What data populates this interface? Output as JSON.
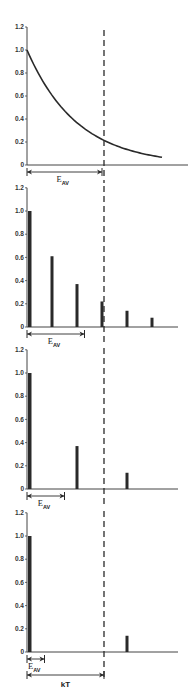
{
  "figure": {
    "dashed_line_label": "kT",
    "annotation_label_main": "E",
    "annotation_label_sub": "AV",
    "colors": {
      "ink": "#2a2a2a",
      "axis": "#444444",
      "background": "#ffffff"
    }
  },
  "chart_data": [
    {
      "type": "line",
      "title": "",
      "xlabel": "",
      "ylabel": "",
      "ylim": [
        0,
        1.2
      ],
      "yticks": [
        "0",
        "0.2",
        "0.4",
        "0.6",
        "0.8",
        "1.0",
        "1.2"
      ],
      "series": [
        {
          "name": "exponential decay",
          "x": [
            0,
            1,
            2,
            3,
            4,
            5,
            5.4
          ],
          "values": [
            1.0,
            0.61,
            0.37,
            0.22,
            0.14,
            0.08,
            0.07
          ]
        }
      ],
      "annotations": [
        {
          "type": "arrow",
          "label": "E_AV",
          "from_x": 0,
          "to_x": 3
        },
        {
          "type": "vline",
          "style": "dashed",
          "x": 3
        }
      ]
    },
    {
      "type": "bar",
      "ylim": [
        0,
        1.2
      ],
      "yticks": [
        "0",
        "0.2",
        "0.4",
        "0.6",
        "0.8",
        "1.0",
        "1.2"
      ],
      "categories": [
        0,
        1,
        2,
        3,
        4,
        5
      ],
      "values": [
        1.0,
        0.61,
        0.37,
        0.22,
        0.14,
        0.08
      ],
      "annotations": [
        {
          "type": "arrow",
          "label": "E_AV",
          "from_x": 0,
          "to_x": 2.3
        },
        {
          "type": "vline",
          "style": "dashed",
          "x": 3
        }
      ]
    },
    {
      "type": "bar",
      "ylim": [
        0,
        1.2
      ],
      "yticks": [
        "0",
        "0.2",
        "0.4",
        "0.6",
        "0.8",
        "1.0",
        "1.2"
      ],
      "categories": [
        0,
        2,
        4
      ],
      "values": [
        1.0,
        0.37,
        0.14
      ],
      "annotations": [
        {
          "type": "arrow",
          "label": "E_AV",
          "from_x": 0,
          "to_x": 1.5
        },
        {
          "type": "vline",
          "style": "dashed",
          "x": 3
        }
      ]
    },
    {
      "type": "bar",
      "ylim": [
        0,
        1.2
      ],
      "yticks": [
        "0",
        "0.2",
        "0.4",
        "0.6",
        "0.8",
        "1.0",
        "1.2"
      ],
      "categories": [
        0,
        4
      ],
      "values": [
        1.0,
        0.14
      ],
      "annotations": [
        {
          "type": "arrow",
          "label": "E_AV",
          "from_x": 0,
          "to_x": 0.7
        },
        {
          "type": "arrow",
          "label": "kT",
          "from_x": 0,
          "to_x": 3
        },
        {
          "type": "vline",
          "style": "dashed",
          "x": 3
        }
      ]
    }
  ]
}
